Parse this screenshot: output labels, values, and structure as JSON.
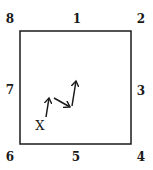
{
  "diagram": {
    "box": {
      "x": 20,
      "y": 31,
      "width": 111,
      "height": 113,
      "stroke": "#1a1a1a"
    },
    "labels": [
      {
        "text": "8",
        "x": 10,
        "y": 19,
        "position": "top-left"
      },
      {
        "text": "1",
        "x": 77,
        "y": 19,
        "position": "top-center"
      },
      {
        "text": "2",
        "x": 141,
        "y": 19,
        "position": "top-right"
      },
      {
        "text": "7",
        "x": 10,
        "y": 90,
        "position": "middle-left"
      },
      {
        "text": "3",
        "x": 141,
        "y": 91,
        "position": "middle-right"
      },
      {
        "text": "6",
        "x": 10,
        "y": 157,
        "position": "bottom-left"
      },
      {
        "text": "5",
        "x": 76,
        "y": 157,
        "position": "bottom-center"
      },
      {
        "text": "4",
        "x": 141,
        "y": 157,
        "position": "bottom-right"
      }
    ],
    "start_marker": {
      "text": "X",
      "x": 40,
      "y": 125
    },
    "arrows": [
      {
        "from": [
          46,
          117
        ],
        "to": [
          49,
          98
        ],
        "direction": "up"
      },
      {
        "from": [
          54,
          98
        ],
        "to": [
          70,
          107
        ],
        "direction": "down-right"
      },
      {
        "from": [
          72,
          106
        ],
        "to": [
          76,
          81
        ],
        "direction": "up"
      }
    ],
    "color": "#1a1a1a"
  }
}
